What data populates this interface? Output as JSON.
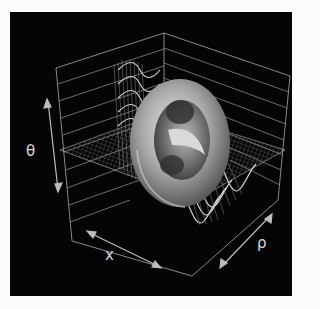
{
  "figure": {
    "background": "#050505",
    "page_background": "#fbfbfb",
    "line_color": "#bdbdbd",
    "axes": {
      "vertical": {
        "label": "θ",
        "arrow": "double-headed"
      },
      "left_depth": {
        "label": "x",
        "arrow": "double-headed"
      },
      "right_depth": {
        "label": "ρ",
        "arrow": "double-headed"
      }
    },
    "elements": [
      {
        "name": "bounding-box",
        "description": "open 3D box with horizontal grid lines on back walls"
      },
      {
        "name": "wireframe-surface",
        "description": "oscillating wave mesh across the floor plane"
      },
      {
        "name": "torus",
        "description": "shaded gray ring standing upright at center"
      }
    ]
  }
}
